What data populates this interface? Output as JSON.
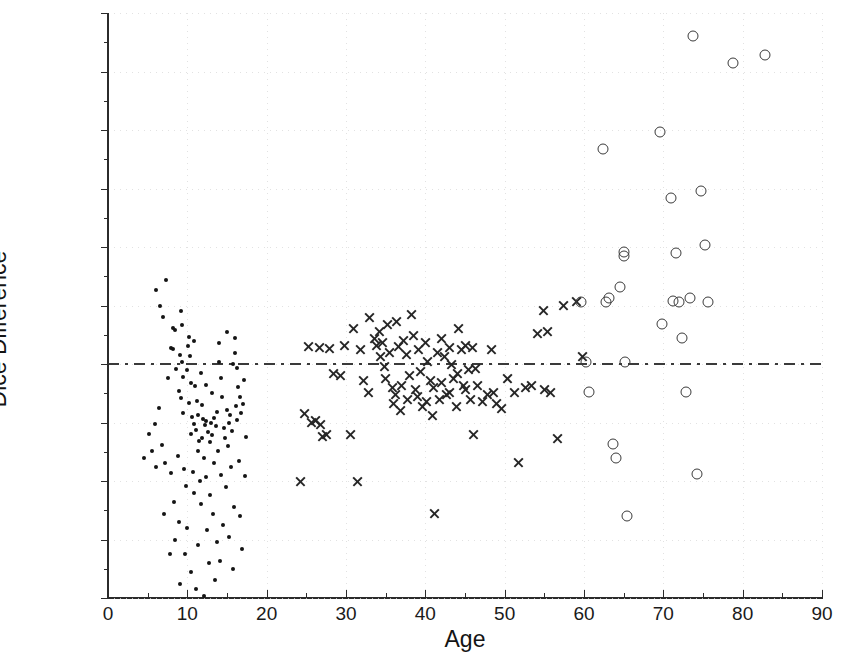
{
  "chart_data": {
    "type": "scatter",
    "title": "",
    "xlabel": "Age",
    "ylabel": "Dice Difference",
    "xlim": [
      0,
      90
    ],
    "ylim": [
      -0.02,
      0.03
    ],
    "xticks": [
      0,
      10,
      20,
      30,
      40,
      50,
      60,
      70,
      80,
      90
    ],
    "xtick_labels": [
      "0",
      "10",
      "20",
      "30",
      "40",
      "50",
      "60",
      "70",
      "80",
      "90"
    ],
    "yticks": [
      -0.02,
      -0.015,
      -0.01,
      -0.005,
      0,
      0.005,
      0.01,
      0.015,
      0.02,
      0.025,
      0.03
    ],
    "ytick_labels": [
      "-0.02",
      "-0.015",
      "-0.01",
      "-0.005",
      "0",
      "0.005",
      "0.01",
      "0.015",
      "0.02",
      "0.025",
      "0.03"
    ],
    "grid": "dotted-faint",
    "legend": null,
    "reference_line": {
      "y": 0,
      "style": "dash-dot",
      "color": "#3a3a3a"
    },
    "series": [
      {
        "name": "children",
        "marker": "dot",
        "color": "#141414",
        "points": [
          [
            6.1,
            0.0063
          ],
          [
            7.3,
            0.0072
          ],
          [
            6.6,
            0.005
          ],
          [
            8.4,
            0.0029
          ],
          [
            7.9,
            0.0014
          ],
          [
            8.2,
            0.0013
          ],
          [
            8.6,
            -0.0004
          ],
          [
            7.6,
            -0.0012
          ],
          [
            9.1,
            0.0008
          ],
          [
            9.3,
            0.0002
          ],
          [
            9.5,
            -0.0011
          ],
          [
            9.2,
            -0.0029
          ],
          [
            9.4,
            -0.0042
          ],
          [
            10.1,
            0.0015
          ],
          [
            10.3,
            0.0007
          ],
          [
            10.0,
            -0.0005
          ],
          [
            10.4,
            -0.0016
          ],
          [
            10.2,
            -0.0033
          ],
          [
            10.6,
            -0.0045
          ],
          [
            10.8,
            -0.0051
          ],
          [
            10.5,
            -0.006
          ],
          [
            11.0,
            -0.0019
          ],
          [
            11.2,
            -0.0032
          ],
          [
            11.4,
            -0.0044
          ],
          [
            11.1,
            -0.0056
          ],
          [
            11.5,
            -0.0066
          ],
          [
            11.3,
            -0.0074
          ],
          [
            11.8,
            -0.0035
          ],
          [
            12.0,
            -0.0047
          ],
          [
            12.2,
            -0.0052
          ],
          [
            12.4,
            -0.0049
          ],
          [
            11.9,
            -0.0063
          ],
          [
            12.6,
            -0.0058
          ],
          [
            12.1,
            -0.008
          ],
          [
            12.8,
            -0.0067
          ],
          [
            13.0,
            -0.005
          ],
          [
            13.3,
            -0.0046
          ],
          [
            13.1,
            -0.0061
          ],
          [
            13.6,
            -0.0053
          ],
          [
            13.8,
            -0.0041
          ],
          [
            14.0,
            0.0002
          ],
          [
            14.2,
            -0.0012
          ],
          [
            14.4,
            -0.0028
          ],
          [
            13.9,
            -0.0074
          ],
          [
            14.6,
            -0.0055
          ],
          [
            14.8,
            -0.0063
          ],
          [
            15.0,
            -0.0039
          ],
          [
            15.2,
            -0.005
          ],
          [
            15.4,
            -0.0044
          ],
          [
            15.6,
            -0.0057
          ],
          [
            15.1,
            -0.007
          ],
          [
            15.8,
            0.0
          ],
          [
            16.0,
            0.0009
          ],
          [
            16.2,
            -0.0003
          ],
          [
            16.4,
            -0.002
          ],
          [
            16.1,
            -0.0036
          ],
          [
            16.6,
            -0.0028
          ],
          [
            16.3,
            -0.0048
          ],
          [
            16.8,
            -0.0042
          ],
          [
            17.0,
            -0.0034
          ],
          [
            5.2,
            -0.006
          ],
          [
            5.6,
            -0.0074
          ],
          [
            6.0,
            -0.0088
          ],
          [
            4.6,
            -0.008
          ],
          [
            6.8,
            -0.0069
          ],
          [
            7.2,
            -0.0085
          ],
          [
            8.0,
            -0.0093
          ],
          [
            8.8,
            -0.0079
          ],
          [
            9.6,
            -0.009
          ],
          [
            10.7,
            -0.0092
          ],
          [
            11.6,
            -0.01
          ],
          [
            12.3,
            -0.0097
          ],
          [
            13.4,
            -0.0085
          ],
          [
            14.3,
            -0.0095
          ],
          [
            15.5,
            -0.0088
          ],
          [
            16.5,
            -0.0083
          ],
          [
            17.3,
            -0.0096
          ],
          [
            9.8,
            -0.0104
          ],
          [
            10.9,
            -0.011
          ],
          [
            12.9,
            -0.0112
          ],
          [
            14.9,
            -0.0105
          ],
          [
            8.3,
            -0.0118
          ],
          [
            11.7,
            -0.012
          ],
          [
            13.2,
            -0.0128
          ],
          [
            15.9,
            -0.0122
          ],
          [
            7.0,
            -0.0128
          ],
          [
            9.0,
            -0.0135
          ],
          [
            10.0,
            -0.014
          ],
          [
            12.5,
            -0.0142
          ],
          [
            14.5,
            -0.0138
          ],
          [
            16.7,
            -0.013
          ],
          [
            8.5,
            -0.015
          ],
          [
            11.3,
            -0.0155
          ],
          [
            13.7,
            -0.0152
          ],
          [
            15.3,
            -0.0148
          ],
          [
            9.7,
            -0.0162
          ],
          [
            12.7,
            -0.017
          ],
          [
            14.1,
            -0.0168
          ],
          [
            10.5,
            -0.0178
          ],
          [
            13.5,
            -0.0185
          ],
          [
            11.1,
            -0.0192
          ],
          [
            15.7,
            -0.0175
          ],
          [
            7.8,
            -0.0162
          ],
          [
            16.9,
            -0.0158
          ],
          [
            12.05,
            -0.0198
          ],
          [
            9.05,
            -0.0188
          ],
          [
            6.4,
            -0.0038
          ],
          [
            5.9,
            -0.0051
          ],
          [
            17.4,
            -0.0062
          ],
          [
            17.1,
            -0.0014
          ],
          [
            8.9,
            -0.0023
          ],
          [
            13.05,
            -0.0025
          ],
          [
            12.35,
            -0.0018
          ],
          [
            11.75,
            -0.0008
          ],
          [
            10.25,
            0.0023
          ],
          [
            9.35,
            0.0033
          ],
          [
            9.15,
            0.0045
          ],
          [
            8.15,
            0.0031
          ],
          [
            10.85,
            0.002
          ],
          [
            14.05,
            0.0018
          ],
          [
            16.05,
            0.0022
          ],
          [
            6.9,
            0.004
          ],
          [
            15.05,
            0.0027
          ]
        ]
      },
      {
        "name": "adults",
        "marker": "x",
        "color": "#262626",
        "points": [
          [
            24.3,
            -0.01
          ],
          [
            24.8,
            -0.0042
          ],
          [
            25.6,
            -0.005
          ],
          [
            26.2,
            -0.0048
          ],
          [
            26.8,
            -0.0052
          ],
          [
            27.0,
            -0.0062
          ],
          [
            27.6,
            -0.006
          ],
          [
            25.3,
            0.0015
          ],
          [
            26.6,
            0.0014
          ],
          [
            27.9,
            0.0013
          ],
          [
            28.4,
            -0.0008
          ],
          [
            29.3,
            -0.001
          ],
          [
            29.8,
            0.0016
          ],
          [
            30.6,
            -0.006
          ],
          [
            31.4,
            -0.01
          ],
          [
            31.0,
            0.003
          ],
          [
            31.8,
            0.0012
          ],
          [
            32.2,
            -0.0014
          ],
          [
            32.8,
            -0.0024
          ],
          [
            33.0,
            0.004
          ],
          [
            33.6,
            0.0022
          ],
          [
            33.9,
            0.0016
          ],
          [
            34.2,
            0.0028
          ],
          [
            34.6,
            0.0018
          ],
          [
            34.4,
            0.0006
          ],
          [
            34.9,
            -0.0002
          ],
          [
            35.2,
            0.0034
          ],
          [
            35.5,
            0.001
          ],
          [
            35.0,
            -0.0012
          ],
          [
            35.8,
            -0.002
          ],
          [
            36.0,
            -0.0034
          ],
          [
            36.4,
            0.0036
          ],
          [
            36.6,
            0.0015
          ],
          [
            36.2,
            -0.0026
          ],
          [
            36.9,
            -0.004
          ],
          [
            37.3,
            0.002
          ],
          [
            37.6,
            0.0008
          ],
          [
            37.0,
            -0.0018
          ],
          [
            37.8,
            -0.003
          ],
          [
            38.2,
            0.0042
          ],
          [
            38.5,
            0.0024
          ],
          [
            38.0,
            -0.001
          ],
          [
            38.8,
            -0.0022
          ],
          [
            39.1,
            0.0012
          ],
          [
            39.4,
            -0.0006
          ],
          [
            39.0,
            -0.0028
          ],
          [
            39.7,
            -0.0036
          ],
          [
            40.0,
            0.0018
          ],
          [
            40.3,
            0.0002
          ],
          [
            40.6,
            -0.0014
          ],
          [
            40.2,
            -0.0032
          ],
          [
            40.9,
            -0.0044
          ],
          [
            41.2,
            -0.0128
          ],
          [
            41.5,
            0.001
          ],
          [
            41.0,
            -0.002
          ],
          [
            41.8,
            -0.003
          ],
          [
            42.1,
            0.0022
          ],
          [
            42.4,
            0.0006
          ],
          [
            42.0,
            -0.0016
          ],
          [
            42.7,
            -0.0026
          ],
          [
            43.0,
            0.0014
          ],
          [
            43.3,
            0.0
          ],
          [
            43.6,
            -0.0012
          ],
          [
            43.1,
            -0.0024
          ],
          [
            43.9,
            -0.0036
          ],
          [
            44.2,
            0.003
          ],
          [
            44.5,
            0.0012
          ],
          [
            44.0,
            -0.0008
          ],
          [
            44.8,
            -0.0018
          ],
          [
            45.1,
            0.0016
          ],
          [
            45.4,
            -0.0005
          ],
          [
            45.0,
            -0.0022
          ],
          [
            45.7,
            -0.003
          ],
          [
            46.0,
            0.0014
          ],
          [
            46.3,
            -0.0004
          ],
          [
            46.6,
            -0.0018
          ],
          [
            46.1,
            -0.006
          ],
          [
            47.2,
            -0.0032
          ],
          [
            47.8,
            -0.0026
          ],
          [
            48.3,
            0.0012
          ],
          [
            48.6,
            -0.0024
          ],
          [
            49.0,
            -0.0034
          ],
          [
            49.6,
            -0.0038
          ],
          [
            50.4,
            -0.0012
          ],
          [
            51.2,
            -0.0024
          ],
          [
            51.8,
            -0.0084
          ],
          [
            52.6,
            -0.002
          ],
          [
            53.4,
            -0.0018
          ],
          [
            54.2,
            0.0026
          ],
          [
            54.9,
            0.0046
          ],
          [
            55.4,
            0.0028
          ],
          [
            55.0,
            -0.0022
          ],
          [
            55.8,
            -0.0024
          ],
          [
            56.6,
            -0.0064
          ],
          [
            57.4,
            0.005
          ],
          [
            59.0,
            0.0053
          ],
          [
            59.8,
            0.0006
          ]
        ]
      },
      {
        "name": "elderly",
        "marker": "circle",
        "color": "#3a3a3a",
        "points": [
          [
            59.6,
            0.0053
          ],
          [
            60.2,
            0.0002
          ],
          [
            60.6,
            -0.0024
          ],
          [
            62.4,
            0.0184
          ],
          [
            62.8,
            0.0053
          ],
          [
            63.2,
            0.0056
          ],
          [
            63.6,
            -0.0068
          ],
          [
            64.0,
            -0.008
          ],
          [
            64.6,
            0.0066
          ],
          [
            65.0,
            0.0096
          ],
          [
            65.1,
            0.0092
          ],
          [
            65.2,
            0.0002
          ],
          [
            65.4,
            -0.013
          ],
          [
            69.6,
            0.0198
          ],
          [
            69.8,
            0.0034
          ],
          [
            71.0,
            0.0142
          ],
          [
            71.2,
            0.0054
          ],
          [
            71.6,
            0.0095
          ],
          [
            72.0,
            0.0053
          ],
          [
            72.4,
            0.0022
          ],
          [
            72.8,
            -0.0024
          ],
          [
            73.8,
            0.028
          ],
          [
            73.4,
            0.0056
          ],
          [
            74.2,
            -0.0094
          ],
          [
            74.8,
            0.0148
          ],
          [
            75.2,
            0.0102
          ],
          [
            75.6,
            0.0053
          ],
          [
            78.8,
            0.0257
          ],
          [
            82.8,
            0.0264
          ]
        ]
      }
    ]
  }
}
